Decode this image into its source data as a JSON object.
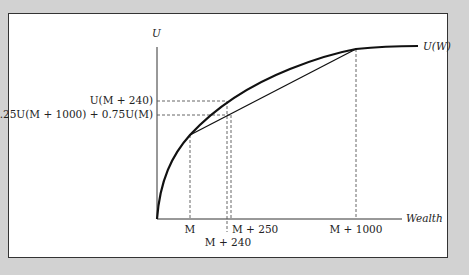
{
  "diagram": {
    "y_axis_label": "U",
    "x_axis_label": "Wealth",
    "curve_label": "U(W)",
    "y_ticks": {
      "u_m240": "U(M + 240)",
      "expected": "0.25U(M + 1000) + 0.75U(M)"
    },
    "x_ticks": {
      "m": "M",
      "m240": "M + 240",
      "m250": "M + 250",
      "m1000": "M + 1000"
    }
  }
}
